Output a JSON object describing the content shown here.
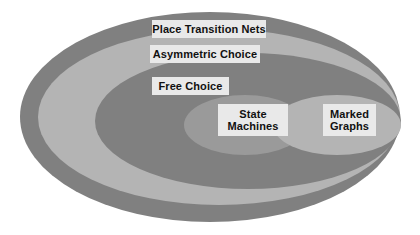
{
  "diagram": {
    "background_color": "#ffffff",
    "colors": {
      "dark_gray": "#808080",
      "light_gray": "#b4b4b4",
      "mid_gray": "#9a9a9a",
      "label_background": "#e9e9e9",
      "label_text": "#111111"
    },
    "regions": [
      {
        "id": "place-transition-nets",
        "label": "Place Transition Nets",
        "fill": "#808080",
        "level": 1
      },
      {
        "id": "asymmetric-choice",
        "label": "Asymmetric Choice",
        "fill": "#b4b4b4",
        "level": 2
      },
      {
        "id": "free-choice",
        "label": "Free Choice",
        "fill": "#808080",
        "level": 3
      },
      {
        "id": "state-machines",
        "label": "State\nMachines",
        "fill": "#9a9a9a",
        "level": 4
      },
      {
        "id": "marked-graphs",
        "label": "Marked\nGraphs",
        "fill": "#b4b4b4",
        "level": 4
      }
    ]
  },
  "chart_data": {
    "type": "diagram",
    "subtype": "nested-ellipse-venn",
    "categories": [
      "Place Transition Nets",
      "Asymmetric Choice",
      "Free Choice",
      "State Machines",
      "Marked Graphs"
    ],
    "nesting": [
      {
        "name": "Place Transition Nets",
        "contains": [
          "Asymmetric Choice"
        ],
        "depth": 0,
        "shape": "ellipse",
        "cx": 210,
        "cy": 117,
        "rx": 190,
        "ry": 105,
        "fill": "#808080"
      },
      {
        "name": "Asymmetric Choice",
        "contains": [
          "Free Choice"
        ],
        "depth": 1,
        "shape": "ellipse",
        "cx": 219,
        "cy": 117,
        "rx": 181,
        "ry": 88,
        "fill": "#b4b4b4"
      },
      {
        "name": "Free Choice",
        "contains": [
          "State Machines",
          "Marked Graphs"
        ],
        "depth": 2,
        "shape": "ellipse",
        "cx": 248,
        "cy": 121,
        "rx": 153,
        "ry": 68,
        "fill": "#808080"
      },
      {
        "name": "State Machines",
        "contains": [],
        "depth": 3,
        "shape": "ellipse",
        "cx": 245,
        "cy": 125,
        "rx": 61,
        "ry": 30,
        "fill": "#9a9a9a"
      },
      {
        "name": "Marked Graphs",
        "contains": [],
        "depth": 3,
        "shape": "ellipse",
        "cx": 337,
        "cy": 125,
        "rx": 64,
        "ry": 30,
        "fill": "#b4b4b4"
      }
    ],
    "overlaps": [
      {
        "a": "State Machines",
        "b": "Marked Graphs"
      }
    ],
    "legend": null,
    "xlabel": "",
    "ylabel": ""
  },
  "labels": {
    "place_transition_nets": "Place Transition Nets",
    "asymmetric_choice": "Asymmetric Choice",
    "free_choice": "Free Choice",
    "state_machines": "State\nMachines",
    "marked_graphs": "Marked\nGraphs"
  }
}
